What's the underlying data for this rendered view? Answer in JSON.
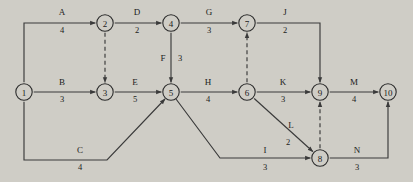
{
  "diagram": {
    "type": "activity-on-arrow-network",
    "background_color": "#cfcdc6",
    "line_color": "#3a3a3a",
    "text_color": "#1b1b1b",
    "nodes": [
      {
        "id": "1",
        "label": "1",
        "x": 24,
        "y": 92
      },
      {
        "id": "2",
        "label": "2",
        "x": 105,
        "y": 23
      },
      {
        "id": "3",
        "label": "3",
        "x": 105,
        "y": 92
      },
      {
        "id": "4",
        "label": "4",
        "x": 171,
        "y": 23
      },
      {
        "id": "5",
        "label": "5",
        "x": 171,
        "y": 92
      },
      {
        "id": "6",
        "label": "6",
        "x": 247,
        "y": 92
      },
      {
        "id": "7",
        "label": "7",
        "x": 247,
        "y": 23
      },
      {
        "id": "8",
        "label": "8",
        "x": 320,
        "y": 158
      },
      {
        "id": "9",
        "label": "9",
        "x": 320,
        "y": 92
      },
      {
        "id": "10",
        "label": "10",
        "x": 388,
        "y": 92
      }
    ],
    "edges": [
      {
        "id": "A",
        "name": "A",
        "duration": "4",
        "from": "1",
        "to": "2",
        "style": "solid",
        "name_x": 62,
        "name_y": 15,
        "dur_x": 62,
        "dur_y": 33
      },
      {
        "id": "B",
        "name": "B",
        "duration": "3",
        "from": "1",
        "to": "3",
        "style": "solid",
        "name_x": 62,
        "name_y": 85,
        "dur_x": 62,
        "dur_y": 102
      },
      {
        "id": "C",
        "name": "C",
        "duration": "4",
        "from": "1",
        "to": "5",
        "style": "solid",
        "name_x": 80,
        "name_y": 153,
        "dur_x": 80,
        "dur_y": 170
      },
      {
        "id": "D",
        "name": "D",
        "duration": "2",
        "from": "2",
        "to": "4",
        "style": "solid",
        "name_x": 137,
        "name_y": 15,
        "dur_x": 137,
        "dur_y": 33
      },
      {
        "id": "E",
        "name": "E",
        "duration": "5",
        "from": "3",
        "to": "5",
        "style": "solid",
        "name_x": 135,
        "name_y": 85,
        "dur_x": 135,
        "dur_y": 102
      },
      {
        "id": "F",
        "name": "F",
        "duration": "3",
        "from": "4",
        "to": "5",
        "style": "solid",
        "name_x": 163,
        "name_y": 61,
        "dur_x": 180,
        "dur_y": 61
      },
      {
        "id": "G",
        "name": "G",
        "duration": "3",
        "from": "4",
        "to": "7",
        "style": "solid",
        "name_x": 209,
        "name_y": 15,
        "dur_x": 209,
        "dur_y": 33
      },
      {
        "id": "H",
        "name": "H",
        "duration": "4",
        "from": "5",
        "to": "6",
        "style": "solid",
        "name_x": 208,
        "name_y": 85,
        "dur_x": 208,
        "dur_y": 102
      },
      {
        "id": "I",
        "name": "I",
        "duration": "3",
        "from": "5",
        "to": "8",
        "style": "solid",
        "name_x": 265,
        "name_y": 153,
        "dur_x": 265,
        "dur_y": 170
      },
      {
        "id": "J",
        "name": "J",
        "duration": "2",
        "from": "7",
        "to": "9",
        "style": "solid",
        "name_x": 285,
        "name_y": 15,
        "dur_x": 285,
        "dur_y": 33
      },
      {
        "id": "K",
        "name": "K",
        "duration": "3",
        "from": "6",
        "to": "9",
        "style": "solid",
        "name_x": 283,
        "name_y": 85,
        "dur_x": 283,
        "dur_y": 102
      },
      {
        "id": "L",
        "name": "L",
        "duration": "2",
        "from": "6",
        "to": "8",
        "style": "solid",
        "name_x": 291,
        "name_y": 128,
        "dur_x": 288,
        "dur_y": 145
      },
      {
        "id": "M",
        "name": "M",
        "duration": "4",
        "from": "9",
        "to": "10",
        "style": "solid",
        "name_x": 354,
        "name_y": 85,
        "dur_x": 354,
        "dur_y": 102
      },
      {
        "id": "N",
        "name": "N",
        "duration": "3",
        "from": "8",
        "to": "10",
        "style": "solid",
        "name_x": 357,
        "name_y": 153,
        "dur_x": 357,
        "dur_y": 170
      }
    ],
    "dummy_edges": [
      {
        "id": "dummy-2-3",
        "from": "2",
        "to": "3",
        "style": "dashed"
      },
      {
        "id": "dummy-6-7",
        "from": "6",
        "to": "7",
        "style": "dashed"
      },
      {
        "id": "dummy-8-9",
        "from": "8",
        "to": "9",
        "style": "dashed"
      }
    ]
  }
}
